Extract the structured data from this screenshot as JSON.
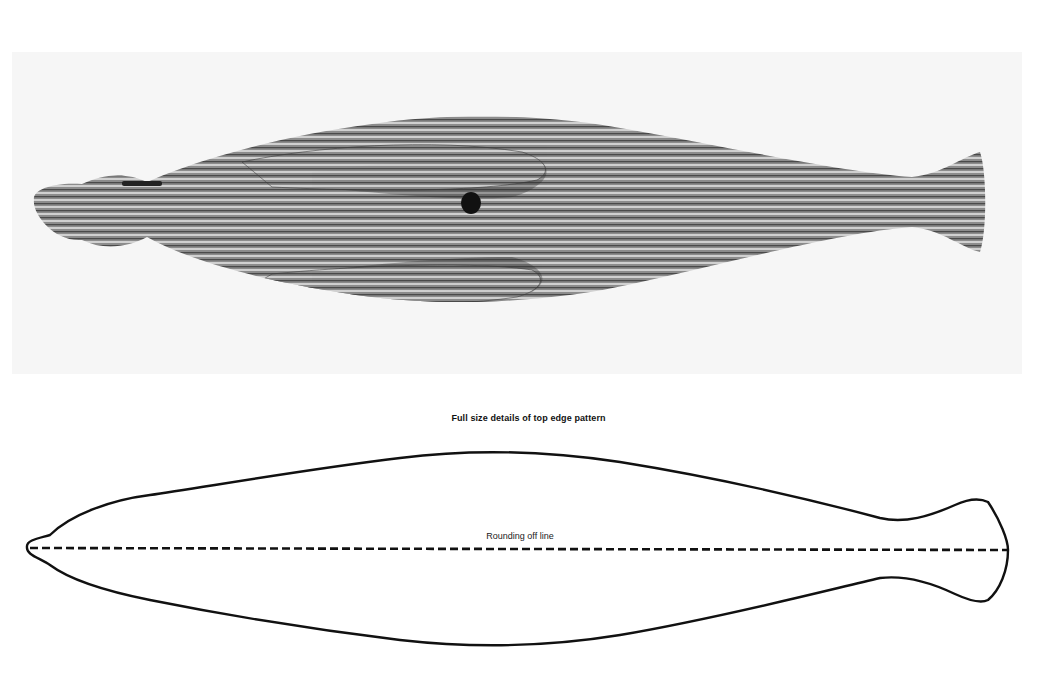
{
  "photo": {
    "subject": "carved-laminated-wood-seal",
    "background_color": "#f6f6f6",
    "wood_colors": {
      "light": "#c9c9c9",
      "mid": "#8e8e8e",
      "dark": "#3a3a3a"
    }
  },
  "diagram": {
    "caption": "Full size details of top edge pattern",
    "centerline_label": "Rounding off line",
    "outline_color": "#111111"
  }
}
